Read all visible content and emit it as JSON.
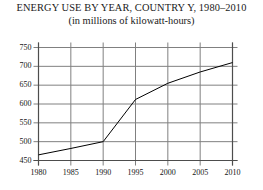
{
  "chart_data": {
    "type": "line",
    "title": "ENERGY USE BY YEAR, COUNTRY Y, 1980–2010",
    "subtitle": "(in millions of kilowatt-hours)",
    "xlabel": "",
    "ylabel": "",
    "x": [
      1980,
      1985,
      1990,
      1995,
      2000,
      2005,
      2010
    ],
    "values": [
      465,
      482,
      500,
      612,
      655,
      685,
      710
    ],
    "series": [
      {
        "name": "Energy use",
        "values": [
          465,
          482,
          500,
          612,
          655,
          685,
          710
        ]
      }
    ],
    "categories": [
      "1980",
      "1985",
      "1990",
      "1995",
      "2000",
      "2005",
      "2010"
    ],
    "xlim": [
      1980,
      2010
    ],
    "ylim": [
      450,
      750
    ],
    "ytick_labels": [
      "750",
      "700",
      "650",
      "600",
      "550",
      "500",
      "450"
    ],
    "ytick_values": [
      750,
      700,
      650,
      600,
      550,
      500,
      450
    ],
    "xtick_labels": [
      "1980",
      "1985",
      "1990",
      "1995",
      "2000",
      "2005",
      "2010"
    ],
    "xtick_values": [
      1980,
      1985,
      1990,
      1995,
      2000,
      2005,
      2010
    ],
    "grid": true,
    "legend": false,
    "legend_position": "none",
    "line_color": "#000000",
    "grid_color": "#808080",
    "axis_color": "#4d4d4d",
    "background_color": "#ffffff"
  }
}
